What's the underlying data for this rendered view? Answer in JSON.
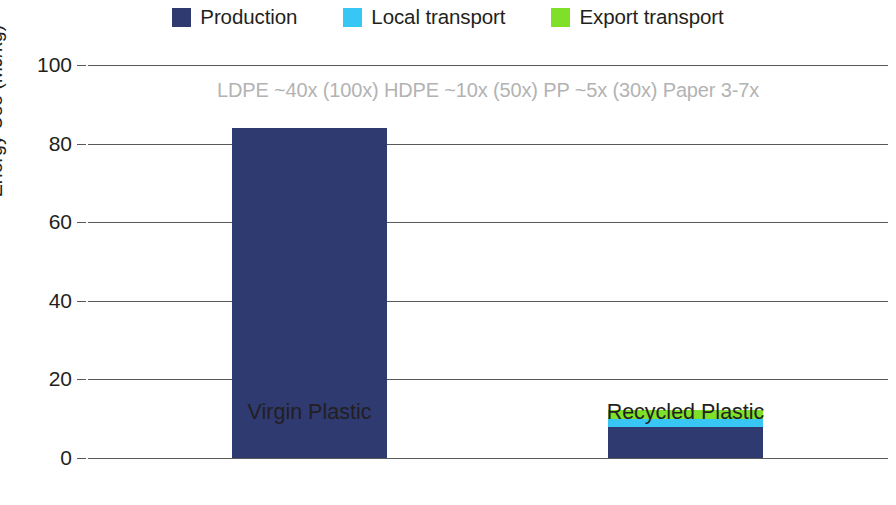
{
  "legend": {
    "items": [
      {
        "label": "Production",
        "color": "#2e3a70",
        "name": "production"
      },
      {
        "label": "Local transport",
        "color": "#38c6f4",
        "name": "local-transport"
      },
      {
        "label": "Export transport",
        "color": "#7ee029",
        "name": "export-transport"
      }
    ]
  },
  "axes": {
    "ylabel": "Energy Use (MJ/kg)",
    "yticks": [
      "0",
      "20",
      "40",
      "60",
      "80",
      "100"
    ],
    "categories": [
      "Virgin Plastic",
      "Recycled Plastic"
    ]
  },
  "annotation": "LDPE ~40x (100x) HDPE ~10x (50x) PP ~5x (30x) Paper 3-7x",
  "chart_data": {
    "type": "bar",
    "subtype": "stacked-bar",
    "title": "",
    "xlabel": "",
    "ylabel": "Energy Use (MJ/kg)",
    "categories": [
      "Virgin Plastic",
      "Recycled Plastic"
    ],
    "series": [
      {
        "name": "Production",
        "color": "#2e3a70",
        "values": [
          84,
          8
        ]
      },
      {
        "name": "Local transport",
        "color": "#38c6f4",
        "values": [
          0,
          2
        ]
      },
      {
        "name": "Export transport",
        "color": "#7ee029",
        "values": [
          0,
          2.2
        ]
      }
    ],
    "totals": [
      84,
      12.2
    ],
    "ylim": [
      0,
      100
    ],
    "ytick_values": [
      0,
      20,
      40,
      60,
      80,
      100
    ],
    "grid": "horizontal",
    "legend_position": "top",
    "annotations": [
      "LDPE ~40x (100x) HDPE ~10x (50x) PP ~5x (30x) Paper 3-7x"
    ],
    "units": "MJ/kg"
  }
}
